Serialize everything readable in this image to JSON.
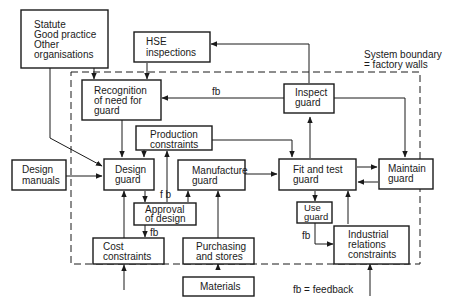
{
  "diagram": {
    "boxes": {
      "statute": [
        "Statute",
        "Good practice",
        "Other",
        "organisations"
      ],
      "hse": [
        "HSE",
        "inspections"
      ],
      "recognition": [
        "Recognition",
        "of need for",
        "guard"
      ],
      "inspect": [
        "Inspect",
        "guard"
      ],
      "production": [
        "Production",
        "constraints"
      ],
      "design_manuals": [
        "Design",
        "manuals"
      ],
      "design_guard": [
        "Design",
        "guard"
      ],
      "manufacture": [
        "Manufacture",
        "guard"
      ],
      "fit_test": [
        "Fit and test",
        "guard"
      ],
      "maintain": [
        "Maintain",
        "guard"
      ],
      "approval": [
        "Approval",
        "of design"
      ],
      "use_guard": [
        "Use",
        "guard"
      ],
      "cost": [
        "Cost",
        "constraints"
      ],
      "purchasing": [
        "Purchasing",
        "and stores"
      ],
      "industrial": [
        "Industrial",
        "relations",
        "constraints"
      ],
      "materials": [
        "Materials"
      ]
    },
    "labels": {
      "system_boundary": [
        "System boundary",
        "=  factory walls"
      ],
      "fb_inspect": "fb",
      "fb_approval_up": "f b",
      "fb_approval_down": "fb",
      "fb_use": "fb",
      "legend": "fb = feedback"
    }
  }
}
